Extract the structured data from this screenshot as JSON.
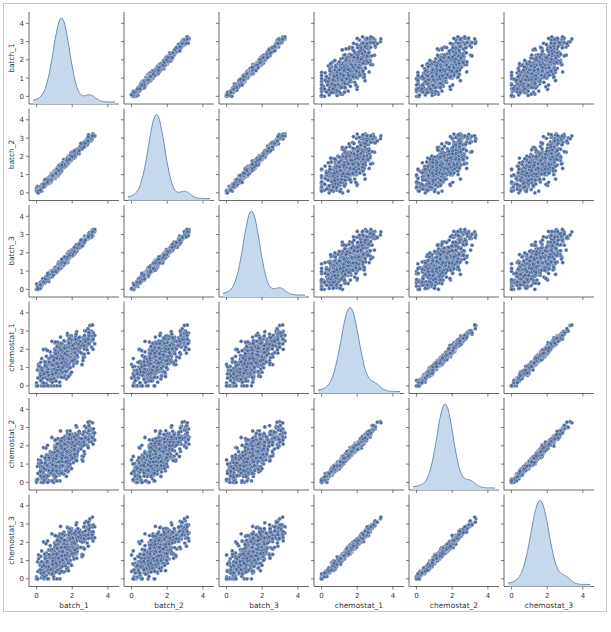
{
  "figure": {
    "type": "pairplot",
    "variables": [
      "batch_1",
      "batch_2",
      "batch_3",
      "chemostat_1",
      "chemostat_2",
      "chemostat_3"
    ],
    "axis_range": [
      0,
      4.4
    ],
    "y_ticks": [
      "0",
      "1",
      "2",
      "3",
      "4"
    ],
    "x_ticks": [
      "0",
      "2",
      "4"
    ],
    "colors": {
      "point_fill": "#4c6a9c",
      "point_edge": "#dfe6f0",
      "kde_fill": "#c6d9ec",
      "kde_line": "#6f8fb3",
      "axis": "#444444",
      "tick_label": "#333333",
      "frame": "#c8c8c8"
    }
  },
  "chart_data": {
    "type": "scatter",
    "title": "",
    "layout": "6x6 pair grid; diagonal = KDE density, off-diagonal = scatter",
    "variables": [
      "batch_1",
      "batch_2",
      "batch_3",
      "chemostat_1",
      "chemostat_2",
      "chemostat_3"
    ],
    "xlim": [
      -0.2,
      4.4
    ],
    "ylim": [
      -0.2,
      4.4
    ],
    "x_tick_labels": [
      "0",
      "2",
      "4"
    ],
    "y_tick_labels": [
      "0",
      "1",
      "2",
      "3",
      "4"
    ],
    "xlabels": [
      "batch_1",
      "batch_2",
      "batch_3",
      "chemostat_1",
      "chemostat_2",
      "chemostat_3"
    ],
    "ylabels": [
      "batch_1",
      "batch_2",
      "batch_3",
      "chemostat_1",
      "chemostat_2",
      "chemostat_3"
    ],
    "diagonal_kde": [
      {
        "variable": "batch_1",
        "peak_x": 1.4,
        "spread": 0.45,
        "shoulder_x": 3.0
      },
      {
        "variable": "batch_2",
        "peak_x": 1.4,
        "spread": 0.45,
        "shoulder_x": 3.0
      },
      {
        "variable": "batch_3",
        "peak_x": 1.4,
        "spread": 0.45,
        "shoulder_x": 3.0
      },
      {
        "variable": "chemostat_1",
        "peak_x": 1.6,
        "spread": 0.5,
        "shoulder_x": 3.0
      },
      {
        "variable": "chemostat_2",
        "peak_x": 1.6,
        "spread": 0.45,
        "shoulder_x": 3.0
      },
      {
        "variable": "chemostat_3",
        "peak_x": 1.6,
        "spread": 0.5,
        "shoulder_x": 3.0
      }
    ],
    "relationships": {
      "within_batch": "tight linear correlation (~0.98), points 0 to ~4.3",
      "within_chemostat": "tight linear correlation (~0.98), points 0 to ~4.3",
      "batch_vs_chemostat": "broad positive correlation (~0.75), wide fan-shaped cloud 0 to ~4.2"
    }
  }
}
